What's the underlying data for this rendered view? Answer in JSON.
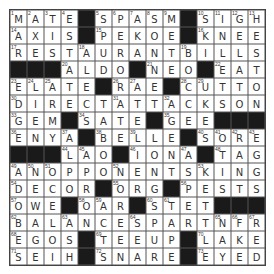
{
  "puzzle": {
    "rows": 15,
    "cols": 15,
    "grid": [
      "MATE#SPASM#SIGH",
      "AXIS#PEKOE#KNEE",
      "RESTAURANTBILLS",
      "###ALDO#NEO#EAT",
      "ELATE#RAE#CUTTO",
      "DIRECTATTACKSON",
      "GEM#SATE#GEE###",
      "ENYA#BELLE#SORE",
      "###LAO#IONA#TAG",
      "ANOPPONENTSKING",
      "DECOR#ORG#PESTS",
      "OWE#OAR#STET###",
      "BALANCESPARTNFR",
      "EGOS#TEEUP#LAKE",
      "SEIH#SNARE#EYED"
    ],
    "numbers": [
      [
        1,
        2,
        3,
        4,
        0,
        5,
        6,
        7,
        8,
        9,
        0,
        10,
        11,
        12,
        13
      ],
      [
        14,
        0,
        0,
        0,
        0,
        15,
        0,
        0,
        0,
        0,
        0,
        16,
        0,
        0,
        0
      ],
      [
        17,
        0,
        0,
        0,
        18,
        0,
        0,
        0,
        0,
        0,
        19,
        0,
        0,
        0,
        0
      ],
      [
        0,
        0,
        0,
        20,
        0,
        0,
        0,
        0,
        21,
        0,
        0,
        0,
        22,
        0,
        0
      ],
      [
        23,
        24,
        25,
        0,
        0,
        0,
        26,
        27,
        0,
        0,
        28,
        29,
        0,
        0,
        0
      ],
      [
        30,
        0,
        0,
        0,
        0,
        0,
        31,
        0,
        0,
        32,
        0,
        0,
        0,
        0,
        0
      ],
      [
        33,
        0,
        0,
        0,
        34,
        0,
        0,
        0,
        0,
        35,
        0,
        0,
        0,
        0,
        0
      ],
      [
        36,
        0,
        0,
        37,
        0,
        38,
        0,
        39,
        0,
        0,
        0,
        40,
        41,
        42,
        43
      ],
      [
        0,
        0,
        0,
        44,
        45,
        0,
        0,
        46,
        0,
        0,
        47,
        0,
        48,
        0,
        0
      ],
      [
        49,
        50,
        51,
        0,
        0,
        0,
        52,
        0,
        0,
        0,
        0,
        53,
        0,
        0,
        0
      ],
      [
        54,
        0,
        0,
        0,
        0,
        0,
        55,
        0,
        0,
        0,
        56,
        0,
        0,
        0,
        0
      ],
      [
        57,
        0,
        0,
        0,
        58,
        59,
        0,
        0,
        60,
        61,
        0,
        0,
        0,
        0,
        0
      ],
      [
        62,
        0,
        0,
        63,
        0,
        0,
        0,
        64,
        0,
        0,
        0,
        0,
        65,
        66,
        67
      ],
      [
        68,
        0,
        0,
        0,
        0,
        69,
        0,
        0,
        0,
        0,
        0,
        70,
        0,
        0,
        0
      ],
      [
        71,
        0,
        0,
        0,
        0,
        72,
        0,
        0,
        0,
        0,
        0,
        73,
        0,
        0,
        0
      ]
    ]
  },
  "colors": {
    "block": "#1a1a1a",
    "cell": "#ffffff",
    "grid_line": "#444444",
    "text": "#333333"
  }
}
